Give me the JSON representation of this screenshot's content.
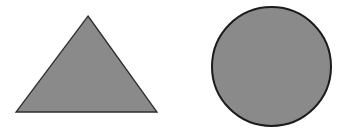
{
  "diagram": {
    "background": "#ffffff",
    "shapes": [
      {
        "id": "triangle",
        "type": "triangle",
        "points": [
          [
            88,
            16
          ],
          [
            157,
            112
          ],
          [
            16,
            112
          ]
        ],
        "fill": "#8a8a8a",
        "stroke": "#2e2e2e",
        "stroke_width": 1.3
      },
      {
        "id": "circle",
        "type": "circle",
        "cx": 271.5,
        "cy": 66.5,
        "rx": 59.5,
        "ry": 59.5,
        "fill": "#8a8a8a",
        "stroke": "#1c1c1c",
        "stroke_width": 2
      }
    ]
  }
}
